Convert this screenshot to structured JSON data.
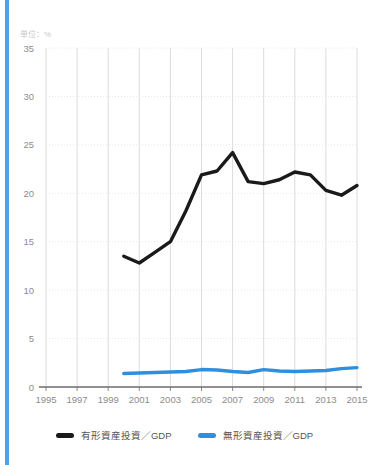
{
  "page": {
    "title": "",
    "unit_label": "単位：%"
  },
  "accent": {
    "color": "#4aa3ef"
  },
  "legend": {
    "position": "bottom-center",
    "items": [
      {
        "label": "有形資産投資／GDP",
        "color": "#1a1a1a"
      },
      {
        "label": "無形資産投資／GDP",
        "color": "#2e8fe0"
      }
    ]
  },
  "chart_data": {
    "type": "line",
    "title": "",
    "xlabel": "",
    "ylabel": "",
    "unit": "%",
    "grid": true,
    "legend_position": "bottom-center",
    "ylim": [
      0,
      35
    ],
    "yticks": [
      0,
      5,
      10,
      15,
      20,
      25,
      30,
      35
    ],
    "ytick_labels": [
      "0",
      "5",
      "10",
      "15",
      "20",
      "25",
      "30",
      "35"
    ],
    "xlim": [
      1995,
      2015
    ],
    "xticks": [
      1995,
      1997,
      1999,
      2001,
      2003,
      2005,
      2007,
      2009,
      2011,
      2013,
      2015
    ],
    "xtick_labels": [
      "1995",
      "1997",
      "1999",
      "2001",
      "2003",
      "2005",
      "2007",
      "2009",
      "2011",
      "2013",
      "2015"
    ],
    "x": [
      2000,
      2001,
      2002,
      2003,
      2004,
      2005,
      2006,
      2007,
      2008,
      2009,
      2010,
      2011,
      2012,
      2013,
      2014,
      2015
    ],
    "series": [
      {
        "name": "有形資産投資／GDP",
        "color": "#1a1a1a",
        "values": [
          13.5,
          12.8,
          13.9,
          15.0,
          18.2,
          21.9,
          22.3,
          24.2,
          21.2,
          21.0,
          21.4,
          22.2,
          21.9,
          20.3,
          19.8,
          20.8
        ]
      },
      {
        "name": "無形資産投資／GDP",
        "color": "#2e8fe0",
        "values": [
          1.4,
          1.45,
          1.5,
          1.55,
          1.6,
          1.8,
          1.75,
          1.6,
          1.5,
          1.8,
          1.65,
          1.6,
          1.65,
          1.7,
          1.9,
          2.0
        ]
      }
    ]
  }
}
